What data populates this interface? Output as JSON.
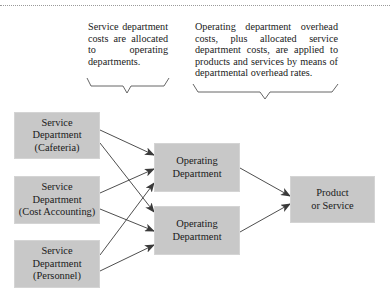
{
  "header": {
    "rule_style": "dotted"
  },
  "annotations": [
    {
      "id": "service-allocation-note",
      "text": "Service department costs are allocated to operating departments."
    },
    {
      "id": "overhead-application-note",
      "text": "Operating department overhead costs, plus allocated service department costs, are applied to products and services by means of departmental overhead rates."
    }
  ],
  "nodes": {
    "service_cafeteria": {
      "line1": "Service",
      "line2": "Department",
      "line3": "(Cafeteria)"
    },
    "service_cost_accounting": {
      "line1": "Service",
      "line2": "Department",
      "line3": "(Cost Accounting)"
    },
    "service_personnel": {
      "line1": "Service",
      "line2": "Department",
      "line3": "(Personnel)"
    },
    "operating_1": {
      "line1": "Operating",
      "line2": "Department"
    },
    "operating_2": {
      "line1": "Operating",
      "line2": "Department"
    },
    "product": {
      "line1": "Product",
      "line2": "or Service"
    }
  },
  "edges": [
    {
      "from": "service_cafeteria",
      "to": "operating_1"
    },
    {
      "from": "service_cafeteria",
      "to": "operating_2"
    },
    {
      "from": "service_cost_accounting",
      "to": "operating_1"
    },
    {
      "from": "service_cost_accounting",
      "to": "operating_2"
    },
    {
      "from": "service_personnel",
      "to": "operating_1"
    },
    {
      "from": "service_personnel",
      "to": "operating_2"
    },
    {
      "from": "operating_1",
      "to": "product"
    },
    {
      "from": "operating_2",
      "to": "product"
    }
  ],
  "colors": {
    "box_fill": "#c8c8c8",
    "arrow": "#3a3a3a",
    "brace": "#555555"
  }
}
